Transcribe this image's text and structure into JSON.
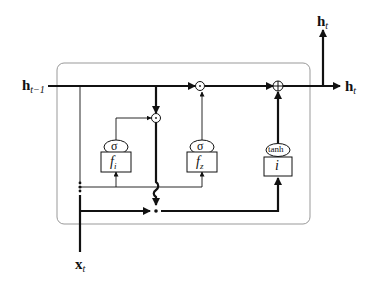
{
  "diagram": {
    "type": "recurrent-cell",
    "inputs": {
      "hidden_prev": {
        "main": "h",
        "sub": "t−1"
      },
      "x": {
        "main": "x",
        "sub": "t"
      }
    },
    "outputs": {
      "hidden_up": {
        "main": "h",
        "sub": "t"
      },
      "hidden_right": {
        "main": "h",
        "sub": "t"
      }
    },
    "gates": [
      {
        "id": "fi",
        "activation": "σ",
        "label": "f",
        "sub": "i"
      },
      {
        "id": "fz",
        "activation": "σ",
        "label": "f",
        "sub": "z"
      },
      {
        "id": "i",
        "activation": "tanh",
        "label": "i",
        "sub": ""
      }
    ],
    "operators": {
      "multiply": "⊙",
      "add": "⊕"
    },
    "colors": {
      "line": "#111111",
      "box_border": "#888888",
      "background": "#ffffff"
    }
  }
}
